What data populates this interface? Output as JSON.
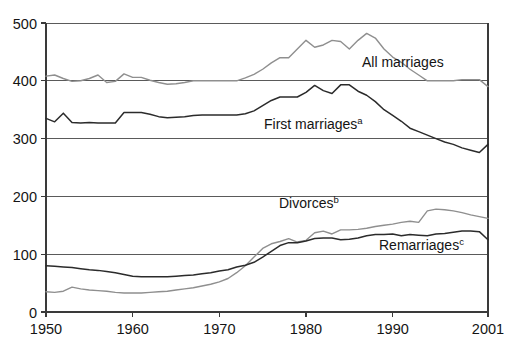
{
  "chart_data": {
    "type": "line",
    "title": "",
    "subtitle": "",
    "xlabel": "",
    "ylabel": "",
    "xlim": [
      1950,
      2001
    ],
    "ylim": [
      0,
      500
    ],
    "grid": true,
    "legend_position": "inline-annotations",
    "y_ticks": [
      "0",
      "100",
      "200",
      "300",
      "400",
      "500"
    ],
    "y_tick_values": [
      0,
      100,
      200,
      300,
      400,
      500
    ],
    "x_ticks": [
      "1950",
      "1960",
      "1970",
      "1980",
      "1990",
      "2001"
    ],
    "x_tick_values": [
      1950,
      1960,
      1970,
      1980,
      1990,
      2001
    ],
    "x": [
      1950,
      1951,
      1952,
      1953,
      1954,
      1955,
      1956,
      1957,
      1958,
      1959,
      1960,
      1961,
      1962,
      1963,
      1964,
      1965,
      1966,
      1967,
      1968,
      1969,
      1970,
      1971,
      1972,
      1973,
      1974,
      1975,
      1976,
      1977,
      1978,
      1979,
      1980,
      1981,
      1982,
      1983,
      1984,
      1985,
      1986,
      1987,
      1988,
      1989,
      1990,
      1991,
      1992,
      1993,
      1994,
      1995,
      1996,
      1997,
      1998,
      1999,
      2000,
      2001
    ],
    "series": [
      {
        "name": "All marriages",
        "color": "#8f8f8f",
        "label_text": "All marriages",
        "superscript": "",
        "values": [
          408,
          410,
          404,
          399,
          400,
          404,
          410,
          397,
          399,
          412,
          406,
          406,
          401,
          397,
          394,
          395,
          397,
          400,
          400,
          400,
          400,
          400,
          400,
          405,
          411,
          420,
          431,
          440,
          440,
          455,
          470,
          458,
          462,
          470,
          468,
          455,
          470,
          482,
          474,
          455,
          441,
          432,
          420,
          410,
          400,
          400,
          400,
          400,
          402,
          402,
          402,
          390
        ]
      },
      {
        "name": "First marriages",
        "color": "#2b2b2b",
        "label_text": "First marriages",
        "superscript": "a",
        "values": [
          335,
          329,
          344,
          328,
          327,
          328,
          327,
          327,
          327,
          345,
          345,
          345,
          342,
          338,
          336,
          337,
          338,
          340,
          341,
          341,
          341,
          341,
          341,
          343,
          348,
          357,
          366,
          372,
          372,
          372,
          380,
          392,
          383,
          378,
          393,
          393,
          382,
          375,
          364,
          350,
          340,
          330,
          318,
          312,
          306,
          300,
          294,
          290,
          284,
          280,
          276,
          290
        ]
      },
      {
        "name": "Divorces",
        "color": "#8f8f8f",
        "label_text": "Divorces",
        "superscript": "b",
        "values": [
          35,
          34,
          36,
          43,
          40,
          38,
          37,
          36,
          34,
          33,
          33,
          33,
          34,
          35,
          36,
          38,
          40,
          42,
          45,
          48,
          52,
          58,
          68,
          80,
          95,
          110,
          118,
          122,
          127,
          121,
          124,
          137,
          140,
          135,
          142,
          142,
          143,
          145,
          148,
          150,
          152,
          155,
          157,
          155,
          175,
          178,
          177,
          175,
          172,
          168,
          165,
          162
        ]
      },
      {
        "name": "Remarriages",
        "color": "#2b2b2b",
        "label_text": "Remarriages",
        "superscript": "c",
        "values": [
          80,
          79,
          78,
          77,
          75,
          73,
          72,
          70,
          68,
          65,
          62,
          61,
          61,
          61,
          61,
          62,
          63,
          64,
          66,
          68,
          71,
          73,
          78,
          81,
          86,
          95,
          105,
          115,
          120,
          120,
          123,
          127,
          128,
          128,
          125,
          126,
          128,
          132,
          134,
          134,
          135,
          132,
          134,
          133,
          132,
          135,
          136,
          138,
          140,
          140,
          139,
          125
        ]
      }
    ],
    "annotations": [
      {
        "text": "All marriages",
        "x_px": 362,
        "y_px": 67,
        "superscript": ""
      },
      {
        "text": "First marriages",
        "x_px": 264,
        "y_px": 129,
        "superscript": "a"
      },
      {
        "text": "Divorces",
        "x_px": 279,
        "y_px": 208,
        "superscript": "b"
      },
      {
        "text": "Remarriages",
        "x_px": 379,
        "y_px": 250,
        "superscript": "c"
      }
    ]
  },
  "plot_geometry": {
    "left_px": 46,
    "right_px": 488,
    "top_px": 23,
    "bottom_px": 312
  }
}
